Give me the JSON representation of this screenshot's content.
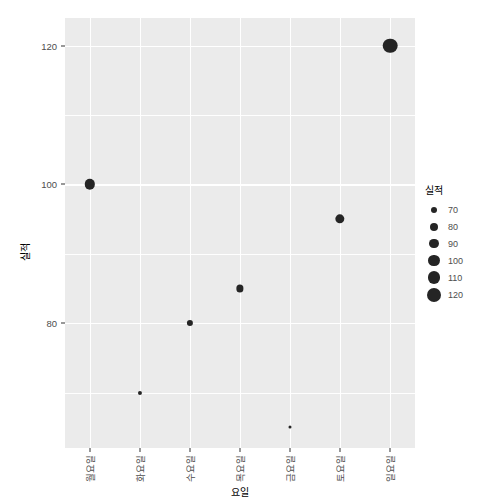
{
  "chart_data": {
    "type": "scatter",
    "title": "",
    "xlabel": "요일",
    "ylabel": "실적",
    "categories": [
      "월요일",
      "화요일",
      "수요일",
      "목요일",
      "금요일",
      "토요일",
      "일요일"
    ],
    "values": [
      100,
      70,
      80,
      85,
      65,
      95,
      120
    ],
    "series": [
      {
        "name": "실적",
        "points": [
          {
            "x": "월요일",
            "y": 100,
            "size": 100
          },
          {
            "x": "화요일",
            "y": 70,
            "size": 70
          },
          {
            "x": "수요일",
            "y": 80,
            "size": 80
          },
          {
            "x": "목요일",
            "y": 85,
            "size": 85
          },
          {
            "x": "금요일",
            "y": 65,
            "size": 65
          },
          {
            "x": "토요일",
            "y": 95,
            "size": 95
          },
          {
            "x": "일요일",
            "y": 120,
            "size": 120
          }
        ]
      }
    ],
    "ylim": [
      62,
      124
    ],
    "y_ticks": [
      80,
      100,
      120
    ],
    "y_tick_labels": [
      "80",
      "100",
      "120"
    ],
    "y_minor_ticks": [
      70,
      90,
      110
    ],
    "grid": true,
    "legend": {
      "title": "실적",
      "position": "right",
      "entries": [
        {
          "label": "70",
          "size": 70,
          "radius": 3.0
        },
        {
          "label": "80",
          "size": 80,
          "radius": 4.0
        },
        {
          "label": "90",
          "size": 90,
          "radius": 4.8
        },
        {
          "label": "100",
          "size": 100,
          "radius": 5.6
        },
        {
          "label": "110",
          "size": 110,
          "radius": 6.3
        },
        {
          "label": "120",
          "size": 120,
          "radius": 7.0
        }
      ]
    },
    "colors": {
      "panel_background": "#ebebeb",
      "gridline": "#ffffff",
      "point": "#252525",
      "axis_text": "#4d4d4d",
      "title_text": "#000000",
      "plot_background": "#ffffff"
    }
  }
}
